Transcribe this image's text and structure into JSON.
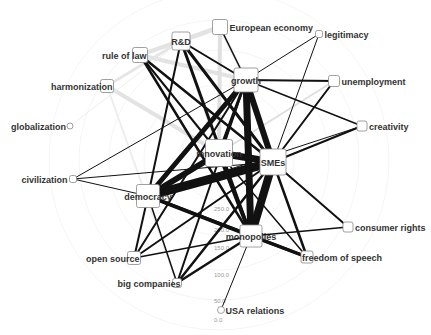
{
  "diagram": {
    "type": "network-graph",
    "radial_scale": {
      "ticks": [
        "0.0",
        "50.0",
        "100.0",
        "150.0",
        "200.0",
        "250.0"
      ]
    },
    "nodes": [
      {
        "id": "rd",
        "label": "R&D",
        "x": 181,
        "y": 41,
        "size": 18,
        "label_pos": "center"
      },
      {
        "id": "european_economy",
        "label": "European economy",
        "x": 220,
        "y": 27,
        "size": 15,
        "label_pos": "right"
      },
      {
        "id": "rule_of_law",
        "label": "rule of law",
        "x": 140,
        "y": 55,
        "size": 15,
        "label_pos": "left-overlap"
      },
      {
        "id": "harmonization",
        "label": "harmonization",
        "x": 107,
        "y": 86,
        "size": 13,
        "label_pos": "left-overlap"
      },
      {
        "id": "globalization",
        "label": "globalization",
        "x": 70,
        "y": 126,
        "size": 4,
        "shape": "circle",
        "label_pos": "left"
      },
      {
        "id": "legitimacy",
        "label": "legitimacy",
        "x": 319,
        "y": 34,
        "size": 7,
        "label_pos": "right"
      },
      {
        "id": "growth",
        "label": "growth",
        "x": 246,
        "y": 80,
        "size": 24,
        "label_pos": "center"
      },
      {
        "id": "unemployment",
        "label": "unemployment",
        "x": 334,
        "y": 81,
        "size": 11,
        "label_pos": "right"
      },
      {
        "id": "creativity",
        "label": "creativity",
        "x": 362,
        "y": 126,
        "size": 10,
        "label_pos": "right"
      },
      {
        "id": "innovation",
        "label": "innovation",
        "x": 219,
        "y": 153,
        "size": 27,
        "label_pos": "center"
      },
      {
        "id": "smes",
        "label": "SMEs",
        "x": 273,
        "y": 162,
        "size": 26,
        "label_pos": "center"
      },
      {
        "id": "civilization",
        "label": "civilization",
        "x": 73,
        "y": 179,
        "size": 7,
        "label_pos": "left"
      },
      {
        "id": "democracy",
        "label": "democracy",
        "x": 148,
        "y": 196,
        "size": 23,
        "label_pos": "center"
      },
      {
        "id": "open_source",
        "label": "open source",
        "x": 134,
        "y": 258,
        "size": 13,
        "label_pos": "left-overlap"
      },
      {
        "id": "big_companies",
        "label": "big companies",
        "x": 177,
        "y": 283,
        "size": 9,
        "label_pos": "left-overlap"
      },
      {
        "id": "monopolies",
        "label": "monopolies",
        "x": 251,
        "y": 236,
        "size": 22,
        "label_pos": "center"
      },
      {
        "id": "consumer_rights",
        "label": "consumer rights",
        "x": 348,
        "y": 227,
        "size": 10,
        "label_pos": "right"
      },
      {
        "id": "freedom_of_speech",
        "label": "freedom of speech",
        "x": 307,
        "y": 257,
        "size": 12,
        "label_pos": "right-overlap"
      },
      {
        "id": "usa_relations",
        "label": "USA relations",
        "x": 221,
        "y": 310,
        "size": 5,
        "shape": "circle",
        "label_pos": "right"
      }
    ],
    "edges": [
      {
        "from": "innovation",
        "to": "smes",
        "w": 7,
        "c": "#111"
      },
      {
        "from": "democracy",
        "to": "smes",
        "w": 9,
        "c": "#111"
      },
      {
        "from": "democracy",
        "to": "innovation",
        "w": 6,
        "c": "#111"
      },
      {
        "from": "growth",
        "to": "smes",
        "w": 6,
        "c": "#111"
      },
      {
        "from": "growth",
        "to": "monopolies",
        "w": 7,
        "c": "#111"
      },
      {
        "from": "growth",
        "to": "democracy",
        "w": 5,
        "c": "#111"
      },
      {
        "from": "growth",
        "to": "innovation",
        "w": 3,
        "c": "#111"
      },
      {
        "from": "smes",
        "to": "monopolies",
        "w": 8,
        "c": "#111"
      },
      {
        "from": "innovation",
        "to": "monopolies",
        "w": 4,
        "c": "#111"
      },
      {
        "from": "democracy",
        "to": "monopolies",
        "w": 4,
        "c": "#111"
      },
      {
        "from": "rd",
        "to": "smes",
        "w": 3,
        "c": "#111"
      },
      {
        "from": "rd",
        "to": "monopolies",
        "w": 3,
        "c": "#111"
      },
      {
        "from": "rd",
        "to": "democracy",
        "w": 2,
        "c": "#111"
      },
      {
        "from": "rd",
        "to": "growth",
        "w": 2,
        "c": "#111"
      },
      {
        "from": "rule_of_law",
        "to": "smes",
        "w": 2.5,
        "c": "#111"
      },
      {
        "from": "rule_of_law",
        "to": "monopolies",
        "w": 2.5,
        "c": "#111"
      },
      {
        "from": "rule_of_law",
        "to": "innovation",
        "w": 2,
        "c": "#111"
      },
      {
        "from": "european_economy",
        "to": "growth",
        "w": 1.5,
        "c": "#111"
      },
      {
        "from": "legitimacy",
        "to": "growth",
        "w": 1,
        "c": "#111"
      },
      {
        "from": "legitimacy",
        "to": "smes",
        "w": 1,
        "c": "#111"
      },
      {
        "from": "unemployment",
        "to": "growth",
        "w": 2,
        "c": "#111"
      },
      {
        "from": "unemployment",
        "to": "smes",
        "w": 2,
        "c": "#111"
      },
      {
        "from": "creativity",
        "to": "growth",
        "w": 1.5,
        "c": "#111"
      },
      {
        "from": "creativity",
        "to": "smes",
        "w": 2,
        "c": "#111"
      },
      {
        "from": "creativity",
        "to": "democracy",
        "w": 1,
        "c": "#111"
      },
      {
        "from": "civilization",
        "to": "smes",
        "w": 1,
        "c": "#111"
      },
      {
        "from": "civilization",
        "to": "democracy",
        "w": 1,
        "c": "#111"
      },
      {
        "from": "civilization",
        "to": "growth",
        "w": 1,
        "c": "#111"
      },
      {
        "from": "open_source",
        "to": "growth",
        "w": 2,
        "c": "#111"
      },
      {
        "from": "open_source",
        "to": "smes",
        "w": 2,
        "c": "#111"
      },
      {
        "from": "open_source",
        "to": "democracy",
        "w": 2,
        "c": "#111"
      },
      {
        "from": "open_source",
        "to": "monopolies",
        "w": 1.5,
        "c": "#111"
      },
      {
        "from": "big_companies",
        "to": "smes",
        "w": 2.5,
        "c": "#111"
      },
      {
        "from": "big_companies",
        "to": "growth",
        "w": 2,
        "c": "#111"
      },
      {
        "from": "big_companies",
        "to": "democracy",
        "w": 1.5,
        "c": "#111"
      },
      {
        "from": "big_companies",
        "to": "monopolies",
        "w": 2.5,
        "c": "#111"
      },
      {
        "from": "consumer_rights",
        "to": "smes",
        "w": 2,
        "c": "#111"
      },
      {
        "from": "consumer_rights",
        "to": "monopolies",
        "w": 1.5,
        "c": "#111"
      },
      {
        "from": "freedom_of_speech",
        "to": "smes",
        "w": 2.5,
        "c": "#111"
      },
      {
        "from": "freedom_of_speech",
        "to": "monopolies",
        "w": 3,
        "c": "#111"
      },
      {
        "from": "freedom_of_speech",
        "to": "innovation",
        "w": 1.5,
        "c": "#111"
      },
      {
        "from": "freedom_of_speech",
        "to": "democracy",
        "w": 1,
        "c": "#111"
      },
      {
        "from": "usa_relations",
        "to": "monopolies",
        "w": 1,
        "c": "#111"
      },
      {
        "from": "democracy",
        "to": "freedom_of_speech",
        "w": 3,
        "c": "#111"
      },
      {
        "from": "rd",
        "to": "european_economy",
        "w": 4,
        "c": "#ddd"
      },
      {
        "from": "rule_of_law",
        "to": "european_economy",
        "w": 4,
        "c": "#e3e3e3"
      },
      {
        "from": "rule_of_law",
        "to": "growth",
        "w": 4,
        "c": "#e3e3e3"
      },
      {
        "from": "harmonization",
        "to": "rd",
        "w": 3,
        "c": "#e6e6e6"
      },
      {
        "from": "harmonization",
        "to": "innovation",
        "w": 4,
        "c": "#e3e3e3"
      },
      {
        "from": "harmonization",
        "to": "big_companies",
        "w": 2,
        "c": "#eee"
      },
      {
        "from": "globalization",
        "to": "rd",
        "w": 1,
        "c": "#eee"
      },
      {
        "from": "european_economy",
        "to": "innovation",
        "w": 4,
        "c": "#e0e0e0"
      },
      {
        "from": "european_economy",
        "to": "growth",
        "w": 3,
        "c": "#ececec"
      },
      {
        "from": "unemployment",
        "to": "innovation",
        "w": 1.5,
        "c": "#ddd"
      },
      {
        "from": "rd",
        "to": "innovation",
        "w": 2,
        "c": "#e8e8e8"
      }
    ]
  }
}
